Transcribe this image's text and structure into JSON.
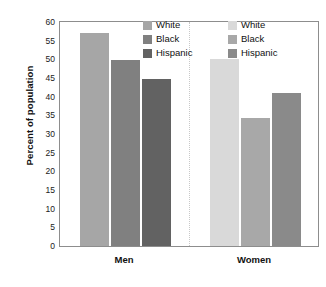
{
  "chart_data": {
    "type": "bar",
    "title": "",
    "subtitle": "",
    "xlabel": "",
    "ylabel": "Percent of population",
    "ylim": [
      0,
      60
    ],
    "ytick_step": 5,
    "yticks": [
      0,
      5,
      10,
      15,
      20,
      25,
      30,
      35,
      40,
      45,
      50,
      55,
      60
    ],
    "ytick_labels": [
      "0",
      "5",
      "10",
      "15",
      "20",
      "25",
      "30",
      "35",
      "40",
      "45",
      "50",
      "55",
      "60"
    ],
    "categories": [
      "Men",
      "Women"
    ],
    "series": [
      {
        "name": "White",
        "values": [
          57.0,
          50.0
        ]
      },
      {
        "name": "Black",
        "values": [
          49.8,
          34.3
        ]
      },
      {
        "name": "Hispanic",
        "values": [
          44.7,
          41.0
        ]
      }
    ],
    "grid": false,
    "legend_position": "inside-top-right-per-group",
    "legends": [
      {
        "group": "Men",
        "entries": [
          {
            "label": "White",
            "color": "#a6a6a6"
          },
          {
            "label": "Black",
            "color": "#808080"
          },
          {
            "label": "Hispanic",
            "color": "#626262"
          }
        ]
      },
      {
        "group": "Women",
        "entries": [
          {
            "label": "White",
            "color": "#d9d9d9"
          },
          {
            "label": "Black",
            "color": "#a8a8a8"
          },
          {
            "label": "Hispanic",
            "color": "#8a8a8a"
          }
        ]
      }
    ],
    "bar_colors": {
      "men": {
        "white": "#a6a6a6",
        "black": "#808080",
        "hispanic": "#626262"
      },
      "women": {
        "white": "#d9d9d9",
        "black": "#a8a8a8",
        "hispanic": "#8a8a8a"
      }
    },
    "annotations": []
  },
  "axis": {
    "y_title": "Percent of population"
  },
  "x_labels": {
    "men": "Men",
    "women": "Women"
  },
  "caption": {
    "text": ""
  },
  "colors": {
    "frame": "#8d8d8d",
    "tick": "#6f6f6f",
    "divider": "#c8c8c8",
    "text": "#111111",
    "background": "#ffffff"
  }
}
